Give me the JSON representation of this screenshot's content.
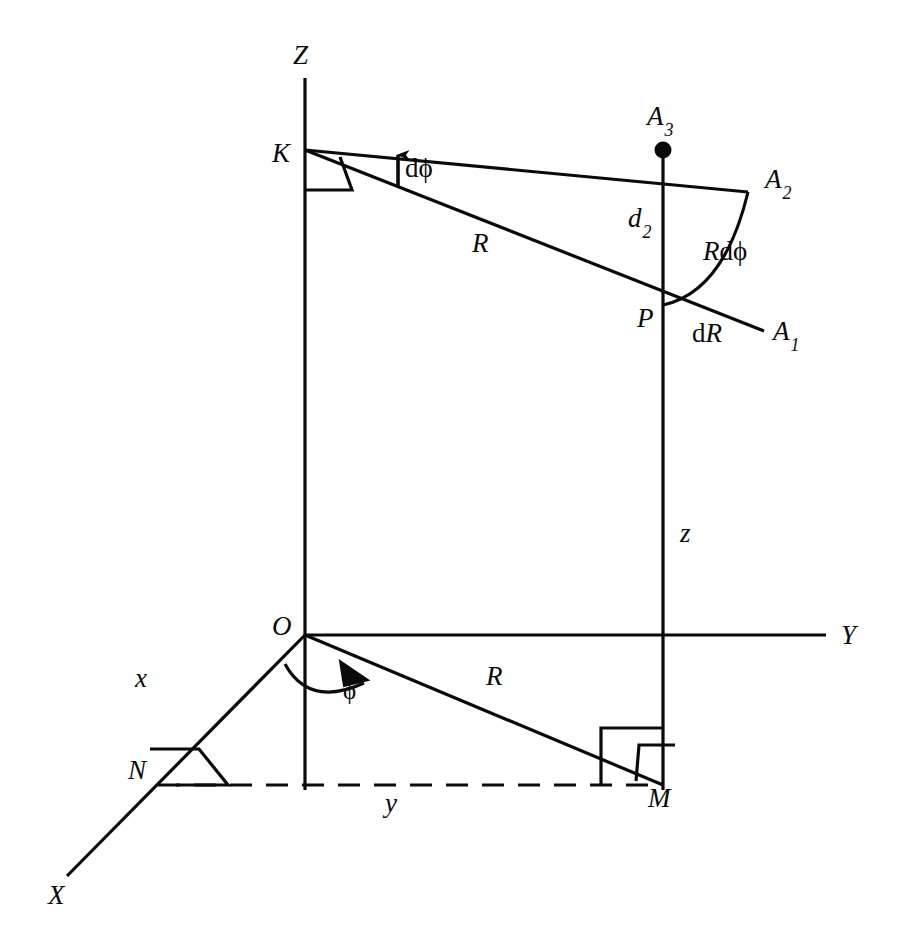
{
  "figure": {
    "type": "geometry-diagram",
    "background_color": "#ffffff",
    "stroke_color": "#0a0a0a",
    "width": 914,
    "height": 936
  },
  "axes": [
    {
      "id": "z-axis",
      "label": "Z",
      "label_x": 293,
      "label_y": 42,
      "from": [
        305,
        78
      ],
      "to": [
        305,
        790
      ]
    },
    {
      "id": "y-axis",
      "label": "Y",
      "label_x": 841,
      "label_y": 622,
      "from": [
        305,
        635
      ],
      "to": [
        826,
        635
      ]
    },
    {
      "id": "x-axis",
      "label": "X",
      "label_x": 48,
      "label_y": 882,
      "from": [
        305,
        635
      ],
      "to": [
        67,
        876
      ]
    }
  ],
  "points": [
    {
      "id": "point-K",
      "label": "K",
      "label_x": 272,
      "label_y": 140,
      "x": 305,
      "y": 150,
      "dot": false
    },
    {
      "id": "point-O",
      "label": "O",
      "label_x": 272,
      "label_y": 613,
      "x": 305,
      "y": 635,
      "dot": false
    },
    {
      "id": "point-P",
      "label": "P",
      "label_x": 637,
      "label_y": 305,
      "x": 663,
      "y": 305,
      "dot": false
    },
    {
      "id": "point-A3",
      "label": "A",
      "sub": "3",
      "label_x": 647,
      "label_y": 103,
      "x": 663,
      "y": 150,
      "dot": true
    },
    {
      "id": "point-A2",
      "label": "A",
      "sub": "2",
      "label_x": 765,
      "label_y": 166,
      "x": 748,
      "y": 192,
      "dot": false
    },
    {
      "id": "point-A1",
      "label": "A",
      "sub": "1",
      "label_x": 773,
      "label_y": 318,
      "x": 764,
      "y": 331,
      "dot": false
    },
    {
      "id": "point-N",
      "label": "N",
      "label_x": 128,
      "label_y": 757,
      "x": 158,
      "y": 785,
      "dot": false
    },
    {
      "id": "point-M",
      "label": "M",
      "label_x": 648,
      "label_y": 785,
      "x": 663,
      "y": 785,
      "dot": false
    }
  ],
  "segment_labels": [
    {
      "id": "label-R-upper",
      "text": "R",
      "style": "italic",
      "x": 472,
      "y": 230
    },
    {
      "id": "label-R-lower",
      "text": "R",
      "style": "italic",
      "x": 486,
      "y": 663
    },
    {
      "id": "label-z",
      "text": "z",
      "style": "italic",
      "x": 680,
      "y": 520
    },
    {
      "id": "label-x",
      "text": "x",
      "style": "italic",
      "x": 135,
      "y": 665
    },
    {
      "id": "label-y",
      "text": "y",
      "style": "italic",
      "x": 385,
      "y": 790
    },
    {
      "id": "label-d2",
      "text": "d",
      "sub": "2",
      "style": "italic",
      "x": 628,
      "y": 205
    },
    {
      "id": "label-dphi",
      "text": "dϕ",
      "style": "upright",
      "x": 405,
      "y": 155
    },
    {
      "id": "label-dR",
      "text": "dR",
      "style": "mixed-dR",
      "x": 692,
      "y": 320
    },
    {
      "id": "label-Rdphi",
      "text": "Rdϕ",
      "style": "mixed-Rdphi",
      "x": 703,
      "y": 238
    },
    {
      "id": "label-phi",
      "text": "ϕ",
      "style": "upright",
      "x": 343,
      "y": 678
    }
  ],
  "lines": [
    {
      "id": "line-K-to-A2",
      "from": [
        305,
        150
      ],
      "to": [
        748,
        192
      ]
    },
    {
      "id": "line-K-through-P-to-A1",
      "from": [
        305,
        150
      ],
      "to": [
        764,
        331
      ]
    },
    {
      "id": "line-A3-vertical-through-P",
      "from": [
        663,
        150
      ],
      "to": [
        663,
        790
      ]
    },
    {
      "id": "line-O-to-M-radial",
      "from": [
        305,
        635
      ],
      "to": [
        663,
        785
      ]
    },
    {
      "id": "line-M-vertical-stub",
      "from": [
        663,
        635
      ],
      "to": [
        663,
        790
      ]
    }
  ],
  "dashed_lines": [
    {
      "id": "dashed-N-to-M",
      "from": [
        158,
        785
      ],
      "to": [
        663,
        785
      ]
    }
  ],
  "arcs": [
    {
      "id": "arc-Rdphi",
      "description": "arc from P up to A2",
      "from": [
        663,
        305
      ],
      "to": [
        748,
        192
      ]
    },
    {
      "id": "arc-phi",
      "description": "azimuth angle arc at origin with arrowhead"
    }
  ],
  "right_angle_marks": [
    {
      "id": "right-angle-K",
      "at": "K",
      "shape": "parallelogram"
    },
    {
      "id": "right-angle-N",
      "at": "N",
      "shape": "parallelogram"
    },
    {
      "id": "right-angle-M-square",
      "at": "M",
      "shape": "square"
    },
    {
      "id": "right-angle-M-parallelogram",
      "at": "M",
      "shape": "parallelogram"
    }
  ],
  "arrows": [
    {
      "id": "arrow-dphi",
      "description": "short up arrow marking dphi between the two K lines",
      "x": 398,
      "tip_y": 153,
      "tail_y": 186
    },
    {
      "id": "arrow-phi",
      "description": "arrowhead at end of phi arc pointing toward R line"
    }
  ]
}
